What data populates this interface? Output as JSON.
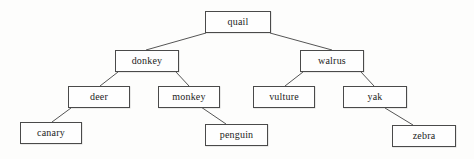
{
  "diagram": {
    "type": "tree",
    "title": "",
    "background_color": "#fdfdfc",
    "node_border_color": "#4a4a4a",
    "node_fill_color": "#fefefe",
    "edge_color": "#555555",
    "text_color": "#1c1c1c",
    "nodes": [
      {
        "id": "quail",
        "label": "quail",
        "x": 205,
        "y": 11,
        "w": 66,
        "h": 22,
        "level": 0
      },
      {
        "id": "donkey",
        "label": "donkey",
        "x": 115,
        "y": 50,
        "w": 64,
        "h": 22,
        "level": 1
      },
      {
        "id": "walrus",
        "label": "walrus",
        "x": 300,
        "y": 50,
        "w": 64,
        "h": 22,
        "level": 1
      },
      {
        "id": "deer",
        "label": "deer",
        "x": 68,
        "y": 86,
        "w": 62,
        "h": 22,
        "level": 2
      },
      {
        "id": "monkey",
        "label": "monkey",
        "x": 158,
        "y": 86,
        "w": 62,
        "h": 22,
        "level": 2
      },
      {
        "id": "vulture",
        "label": "vulture",
        "x": 253,
        "y": 86,
        "w": 62,
        "h": 22,
        "level": 2
      },
      {
        "id": "yak",
        "label": "yak",
        "x": 343,
        "y": 86,
        "w": 64,
        "h": 22,
        "level": 2
      },
      {
        "id": "canary",
        "label": "canary",
        "x": 20,
        "y": 122,
        "w": 62,
        "h": 22,
        "level": 3
      },
      {
        "id": "penguin",
        "label": "penguin",
        "x": 205,
        "y": 124,
        "w": 63,
        "h": 22,
        "level": 3
      },
      {
        "id": "zebra",
        "label": "zebra",
        "x": 392,
        "y": 125,
        "w": 64,
        "h": 22,
        "level": 3
      }
    ],
    "edges": [
      {
        "from": "quail",
        "to": "donkey",
        "x1": 206,
        "y1": 33,
        "x2": 146,
        "y2": 50
      },
      {
        "from": "quail",
        "to": "walrus",
        "x1": 270,
        "y1": 33,
        "x2": 332,
        "y2": 50
      },
      {
        "from": "donkey",
        "to": "deer",
        "x1": 118,
        "y1": 72,
        "x2": 100,
        "y2": 86
      },
      {
        "from": "donkey",
        "to": "monkey",
        "x1": 176,
        "y1": 72,
        "x2": 189,
        "y2": 86
      },
      {
        "from": "walrus",
        "to": "vulture",
        "x1": 303,
        "y1": 72,
        "x2": 285,
        "y2": 86
      },
      {
        "from": "walrus",
        "to": "yak",
        "x1": 361,
        "y1": 72,
        "x2": 374,
        "y2": 86
      },
      {
        "from": "deer",
        "to": "canary",
        "x1": 71,
        "y1": 108,
        "x2": 52,
        "y2": 122
      },
      {
        "from": "monkey",
        "to": "penguin",
        "x1": 201,
        "y1": 107,
        "x2": 226,
        "y2": 124
      },
      {
        "from": "yak",
        "to": "zebra",
        "x1": 385,
        "y1": 108,
        "x2": 413,
        "y2": 125
      }
    ]
  }
}
